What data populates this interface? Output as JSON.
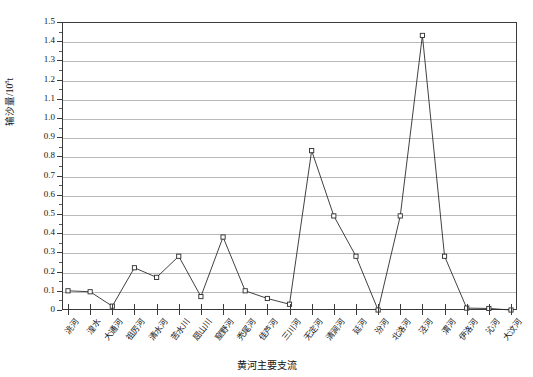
{
  "chart_data": {
    "type": "line",
    "title": "",
    "xlabel": "黄河主要支流",
    "ylabel": "输沙量/10",
    "ylabel_exponent": "8",
    "ylabel_unit": "t",
    "categories": [
      "洮河",
      "湟水",
      "大通河",
      "祖厉河",
      "清水河",
      "苦水川",
      "屈山川",
      "窟野河",
      "秃尾河",
      "佳芦河",
      "三川河",
      "无定河",
      "清涧河",
      "延河",
      "汾河",
      "北洛河",
      "泾河",
      "渭河",
      "伊洛河",
      "沁河",
      "大汶河"
    ],
    "values": [
      0.1,
      0.095,
      0.02,
      0.22,
      0.17,
      0.28,
      0.07,
      0.38,
      0.1,
      0.06,
      0.03,
      0.83,
      0.49,
      0.28,
      0.0,
      0.49,
      1.43,
      0.28,
      0.01,
      0.008,
      0.0
    ],
    "ylim": [
      0,
      1.5
    ],
    "ytick_labels": [
      "0",
      "0.1",
      "0.2",
      "0.3",
      "0.4",
      "0.5",
      "0.6",
      "0.7",
      "0.8",
      "0.9",
      "1.0",
      "1.1",
      "1.2",
      "1.3",
      "1.4",
      "1.5"
    ],
    "ytick_values": [
      0,
      0.1,
      0.2,
      0.3,
      0.4,
      0.5,
      0.6,
      0.7,
      0.8,
      0.9,
      1.0,
      1.1,
      1.2,
      1.3,
      1.4,
      1.5
    ],
    "grid": true,
    "grid_color": "#b9b9b9",
    "legend": null,
    "series_color": "#2b2b2b",
    "marker": "open-square"
  }
}
